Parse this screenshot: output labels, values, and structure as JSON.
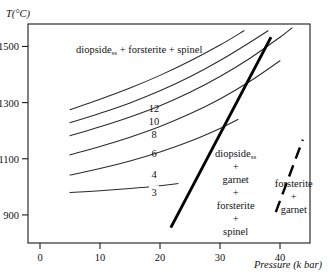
{
  "chart_data": {
    "type": "line",
    "title": "",
    "xlabel": "Pressure (k bar)",
    "ylabel": "T(°C)",
    "xlim": [
      -2,
      45
    ],
    "ylim": [
      800,
      1580
    ],
    "xticks": [
      0,
      10,
      20,
      30,
      40
    ],
    "xtick_labels": [
      "0",
      "10",
      "20",
      "30",
      "40"
    ],
    "yticks": [
      900,
      1100,
      1300,
      1500
    ],
    "ytick_labels": [
      "900",
      "1100",
      "1300",
      "1500"
    ],
    "grid": false,
    "legend": "none",
    "series": [
      {
        "name": "12",
        "label": "12",
        "label_x": 19.0,
        "label_y": 1280,
        "points": [
          [
            5,
            1275
          ],
          [
            10,
            1312
          ],
          [
            15,
            1352
          ],
          [
            20,
            1397
          ],
          [
            25,
            1448
          ],
          [
            30,
            1505
          ],
          [
            34,
            1556
          ]
        ]
      },
      {
        "name": "10",
        "label": "10",
        "label_x": 19.0,
        "label_y": 1235,
        "points": [
          [
            5,
            1228
          ],
          [
            10,
            1262
          ],
          [
            15,
            1299
          ],
          [
            20,
            1342
          ],
          [
            25,
            1392
          ],
          [
            30,
            1450
          ],
          [
            35,
            1515
          ],
          [
            38,
            1556
          ]
        ]
      },
      {
        "name": "8",
        "label": "8",
        "label_x": 19.0,
        "label_y": 1190,
        "points": [
          [
            5,
            1182
          ],
          [
            10,
            1214
          ],
          [
            15,
            1249
          ],
          [
            20,
            1289
          ],
          [
            25,
            1337
          ],
          [
            30,
            1393
          ],
          [
            35,
            1458
          ],
          [
            40,
            1533
          ],
          [
            42,
            1566
          ]
        ]
      },
      {
        "name": "6",
        "label": "6",
        "label_x": 19.0,
        "label_y": 1122,
        "points": [
          [
            5,
            1114
          ],
          [
            10,
            1144
          ],
          [
            15,
            1177
          ],
          [
            20,
            1215
          ],
          [
            25,
            1260
          ],
          [
            30,
            1313
          ],
          [
            35,
            1376
          ],
          [
            40,
            1449
          ]
        ]
      },
      {
        "name": "4",
        "label": "4",
        "label_x": 19.0,
        "label_y": 1045,
        "points": [
          [
            5,
            1042
          ],
          [
            10,
            1065
          ],
          [
            15,
            1092
          ],
          [
            20,
            1124
          ],
          [
            25,
            1162
          ],
          [
            30,
            1208
          ],
          [
            33,
            1240
          ]
        ]
      },
      {
        "name": "3",
        "label": "3",
        "label_x": 19.0,
        "label_y": 980,
        "points": [
          [
            5,
            980
          ],
          [
            10,
            986
          ],
          [
            15,
            994
          ],
          [
            20,
            1004
          ],
          [
            23,
            1012
          ]
        ]
      }
    ],
    "boundaries": [
      {
        "name": "reaction-boundary-solid",
        "style": "solid",
        "points": [
          [
            21.8,
            855
          ],
          [
            38.5,
            1533
          ]
        ]
      },
      {
        "name": "reaction-boundary-dashed",
        "style": "dashed",
        "points": [
          [
            39.3,
            910
          ],
          [
            43.8,
            1168
          ]
        ]
      }
    ],
    "annotations": [
      {
        "name": "field-label-upper-left",
        "text": "diopsideₛₛ + forsterite + spinel",
        "base": "diopside",
        "sub": "ss",
        "rest": " + forsterite + spinel",
        "x": 6.0,
        "y": 1478
      },
      {
        "name": "field-label-center",
        "lines": [
          "diopside",
          "+",
          "garnet",
          "+",
          "forsterite",
          "+",
          "spinel"
        ],
        "sub_on_line": 0,
        "sub": "ss",
        "x": 32.6,
        "y": 1108
      },
      {
        "name": "field-label-right",
        "lines": [
          "forsterite",
          "+",
          "garnet"
        ],
        "x": 42.3,
        "y": 1000
      }
    ]
  },
  "axes": {
    "y_title": "T(°C)",
    "x_title_italic_main": "Pressure",
    "x_title_italic_unit": "(k bar)"
  },
  "labels": {
    "upper_field_base": "diopside",
    "upper_field_sub": "ss",
    "upper_field_rest": "+ forsterite + spinel",
    "center_field": [
      "diopside",
      "+",
      "garnet",
      "+",
      "forsterite",
      "+",
      "spinel"
    ],
    "center_field_sub": "ss",
    "right_field": [
      "forsterite",
      "+",
      "garnet"
    ],
    "curve_12": "12",
    "curve_10": "10",
    "curve_8": "8",
    "curve_6": "6",
    "curve_4": "4",
    "curve_3": "3"
  }
}
